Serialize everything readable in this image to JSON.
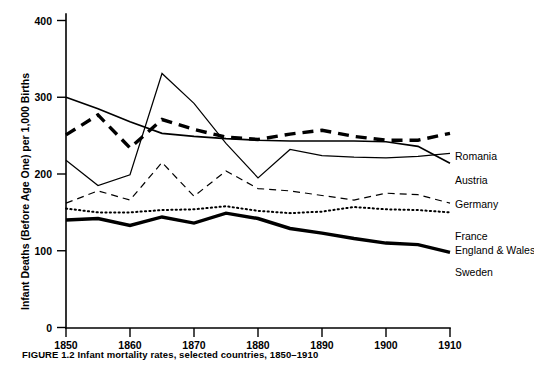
{
  "figure": {
    "caption": "FIGURE 1.2   Infant mortality rates, selected countries, 1850–1910"
  },
  "chart_data": {
    "type": "line",
    "title": "",
    "xlabel": "",
    "ylabel": "Infant Deaths (Before Age One) per 1,000 Births",
    "xlim": [
      1850,
      1910
    ],
    "ylim": [
      0,
      400
    ],
    "xticks": [
      1850,
      1860,
      1870,
      1880,
      1890,
      1900,
      1910
    ],
    "xtick_labels": [
      "1850",
      "1860",
      "1870",
      "1880",
      "1890",
      "1900",
      "1910"
    ],
    "yticks": [
      0,
      100,
      200,
      300,
      400
    ],
    "ytick_labels": [
      "0",
      "100",
      "200",
      "300",
      "400"
    ],
    "grid": false,
    "legend_position": "right-inline",
    "x": [
      1850,
      1855,
      1860,
      1865,
      1870,
      1875,
      1880,
      1885,
      1890,
      1895,
      1900,
      1905,
      1910
    ],
    "series": [
      {
        "name": "Romania",
        "style": "solid-medium",
        "values": [
          300,
          285,
          268,
          253,
          249,
          246,
          244,
          243,
          243,
          243,
          242,
          236,
          214
        ]
      },
      {
        "name": "Austria",
        "style": "dashed-thick",
        "values": [
          251,
          277,
          234,
          271,
          258,
          248,
          245,
          252,
          257,
          249,
          244,
          244,
          253
        ]
      },
      {
        "name": "Germany",
        "style": "solid-thin",
        "values": [
          218,
          185,
          199,
          331,
          292,
          240,
          195,
          232,
          224,
          222,
          221,
          223,
          227
        ]
      },
      {
        "name": "France",
        "style": "dashed-thin",
        "values": [
          162,
          178,
          166,
          215,
          171,
          204,
          181,
          178,
          172,
          166,
          175,
          173,
          162
        ]
      },
      {
        "name": "England & Wales",
        "style": "dotted",
        "values": [
          155,
          150,
          150,
          153,
          154,
          158,
          152,
          149,
          151,
          157,
          154,
          153,
          150
        ]
      },
      {
        "name": "Sweden",
        "style": "solid-thick",
        "values": [
          140,
          142,
          133,
          144,
          136,
          149,
          142,
          129,
          123,
          116,
          110,
          108,
          98
        ]
      }
    ],
    "annotations": [
      {
        "label": "Romania",
        "x": 1910,
        "y": 214
      },
      {
        "label": "Austria",
        "x": 1910,
        "y": 253
      },
      {
        "label": "Germany",
        "x": 1910,
        "y": 227
      },
      {
        "label": "France",
        "x": 1910,
        "y": 162
      },
      {
        "label": "England & Wales",
        "x": 1910,
        "y": 150
      },
      {
        "label": "Sweden",
        "x": 1910,
        "y": 98
      }
    ]
  },
  "legend": {
    "items": [
      {
        "label": "Romania"
      },
      {
        "label": "Austria"
      },
      {
        "label": "Germany"
      },
      {
        "label": "France"
      },
      {
        "label": "England & Wales"
      },
      {
        "label": "Sweden"
      }
    ]
  }
}
